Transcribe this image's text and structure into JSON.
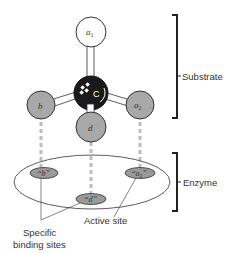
{
  "diagram": {
    "molecule": {
      "center_atom": "C",
      "atoms": [
        {
          "id": "a1",
          "label": "a1",
          "label_base": "a",
          "label_sub": "1",
          "fill": "#ffffff"
        },
        {
          "id": "b",
          "label": "b",
          "fill": "#a8a8a8"
        },
        {
          "id": "d",
          "label": "d",
          "fill": "#a8a8a8"
        },
        {
          "id": "a2",
          "label": "a2",
          "label_base": "a",
          "label_sub": "2",
          "fill": "#a8a8a8"
        }
      ]
    },
    "enzyme_sites": [
      {
        "id": "site-b",
        "label": "“b”"
      },
      {
        "id": "site-d",
        "label": "“d”"
      },
      {
        "id": "site-a2",
        "label_base": "“a",
        "label_sub": "2",
        "label_end": "”"
      }
    ],
    "brackets": {
      "substrate": "Substrate",
      "enzyme": "Enzyme"
    },
    "annotations": {
      "active_site": "Active site",
      "specific_binding_line1": "Specific",
      "specific_binding_line2": "binding sites"
    },
    "colors": {
      "atom_gray": "#a8a8a8",
      "site_gray": "#9a9a9a",
      "carbon": "#1a1a1a",
      "dashed_line": "#bdbdbd",
      "stroke": "#333333"
    }
  }
}
